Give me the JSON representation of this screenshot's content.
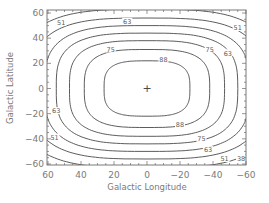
{
  "chart_data": {
    "type": "contour",
    "title": "",
    "xlabel": "Galactic Longitude",
    "ylabel": "Galactic Latitude",
    "xlim": [
      60,
      -60
    ],
    "ylim": [
      -60,
      60
    ],
    "x_reversed": true,
    "x_ticks": [
      60,
      40,
      20,
      0,
      -20,
      -40,
      -60
    ],
    "y_ticks": [
      60,
      40,
      20,
      0,
      -20,
      -40,
      -60
    ],
    "x_tick_labels": [
      "60",
      "40",
      "20",
      "0",
      "−20",
      "−40",
      "−60"
    ],
    "y_tick_labels": [
      "60",
      "40",
      "20",
      "0",
      "−20",
      "−40",
      "−60"
    ],
    "grid": false,
    "legend": null,
    "center_marker": {
      "symbol": "+",
      "x": 0,
      "y": 0
    },
    "contour_levels": [
      100,
      88,
      75,
      63,
      51,
      38
    ],
    "contour_labels": [
      {
        "text": "51",
        "x": 52,
        "y": 52
      },
      {
        "text": "63",
        "x": 12,
        "y": 53
      },
      {
        "text": "75",
        "x": 22,
        "y": 31
      },
      {
        "text": "88",
        "x": -10,
        "y": 23
      },
      {
        "text": "75",
        "x": -38,
        "y": 31
      },
      {
        "text": "63",
        "x": -49,
        "y": 28
      },
      {
        "text": "51",
        "x": -55,
        "y": 48
      },
      {
        "text": "88",
        "x": -20,
        "y": -29
      },
      {
        "text": "75",
        "x": -33,
        "y": -40
      },
      {
        "text": "63",
        "x": -37,
        "y": -49
      },
      {
        "text": "51",
        "x": -47,
        "y": -56
      },
      {
        "text": "38",
        "x": -57,
        "y": -56
      },
      {
        "text": "63",
        "x": 55,
        "y": -18
      },
      {
        "text": "51",
        "x": 56,
        "y": -39
      }
    ]
  },
  "colors": {
    "line": "#4a4a4a",
    "text": "#7a7a7a",
    "background": "#ffffff"
  }
}
